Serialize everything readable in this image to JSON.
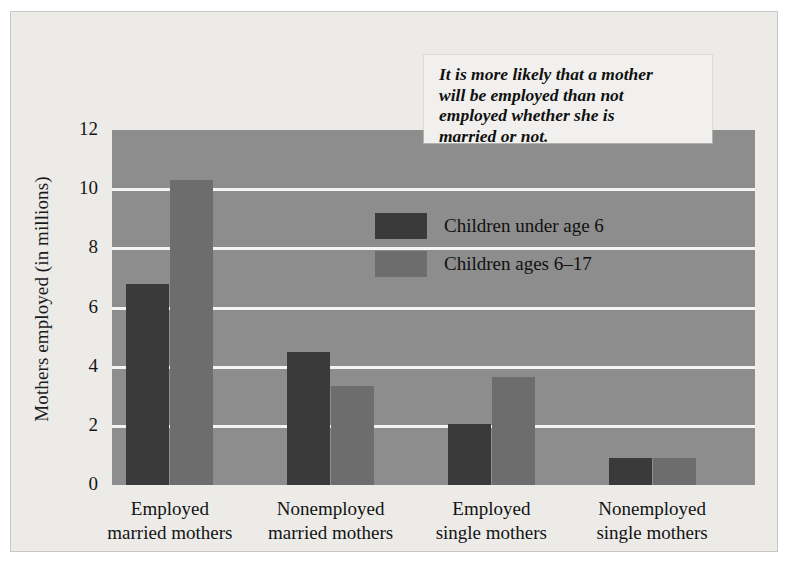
{
  "chart_data": {
    "type": "bar",
    "title": "",
    "xlabel": "",
    "ylabel": "Mothers employed (in millions)",
    "ylim": [
      0,
      12
    ],
    "ytick_values": [
      12,
      10,
      8,
      6,
      4,
      2,
      0
    ],
    "ytick_labels": [
      "12",
      "10",
      "8",
      "6",
      "4",
      "2",
      "0"
    ],
    "grid": true,
    "grid_axis": "y",
    "legend_position": "inside-upper-center",
    "categories": [
      "Employed married mothers",
      "Nonemployed married mothers",
      "Employed single mothers",
      "Nonemployed single mothers"
    ],
    "category_lines": [
      [
        "Employed",
        "married mothers"
      ],
      [
        "Nonemployed",
        "married mothers"
      ],
      [
        "Employed",
        "single mothers"
      ],
      [
        "Nonemployed",
        "single mothers"
      ]
    ],
    "series": [
      {
        "name": "Children under age 6",
        "color": "#3a3a3a",
        "values": [
          6.8,
          4.5,
          2.05,
          0.9
        ]
      },
      {
        "name": "Children ages 6–17",
        "color": "#6d6d6d",
        "values": [
          10.3,
          3.35,
          3.65,
          0.9
        ]
      }
    ],
    "annotations": [
      {
        "name": "callout",
        "text": "It is more likely that a mother will be employed than not employed whether she is married or not.",
        "lines": [
          "It is more likely that a mother",
          "will be employed than not",
          "employed whether she is",
          "married or not."
        ]
      }
    ],
    "colors": {
      "plot_background": "#8d8d8d",
      "figure_background": "#ecebe8",
      "gridline": "#f4f4f2",
      "series_under_6": "#3a3a3a",
      "series_6_to_17": "#6d6d6d",
      "callout_background": "#f1f0ee",
      "text": "#111111"
    }
  }
}
